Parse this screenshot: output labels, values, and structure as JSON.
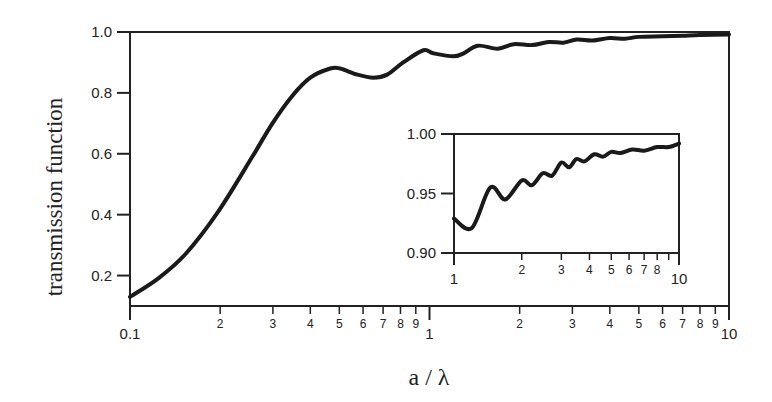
{
  "chart_data": [
    {
      "type": "line",
      "title": "",
      "xlabel": "a / λ",
      "ylabel": "transmission function",
      "xscale": "log",
      "xlim": [
        0.1,
        10
      ],
      "ylim": [
        0.1,
        1.0
      ],
      "grid": false,
      "legend": null,
      "x_major_ticks": [
        0.1,
        1,
        10
      ],
      "x_major_labels": [
        "0.1",
        "1",
        "10"
      ],
      "x_minor_labels": [
        "2",
        "3",
        "4",
        "5",
        "6",
        "7",
        "8",
        "9"
      ],
      "y_ticks": [
        0.2,
        0.4,
        0.6,
        0.8,
        1.0
      ],
      "y_tick_labels": [
        "0.2",
        "0.4",
        "0.6",
        "0.8",
        "1.0"
      ],
      "series": [
        {
          "name": "transmission function",
          "x": [
            0.1,
            0.124,
            0.153,
            0.197,
            0.256,
            0.299,
            0.348,
            0.4,
            0.466,
            0.503,
            0.574,
            0.649,
            0.722,
            0.817,
            0.954,
            1.03,
            1.2,
            1.3,
            1.45,
            1.69,
            1.91,
            2.2,
            2.5,
            2.8,
            3.1,
            3.5,
            4.0,
            4.5,
            5.0,
            6.0,
            7.0,
            8.0,
            10.0
          ],
          "y": [
            0.13,
            0.19,
            0.27,
            0.41,
            0.59,
            0.7,
            0.79,
            0.85,
            0.88,
            0.88,
            0.86,
            0.85,
            0.86,
            0.9,
            0.94,
            0.93,
            0.92,
            0.93,
            0.955,
            0.945,
            0.96,
            0.957,
            0.967,
            0.965,
            0.975,
            0.972,
            0.98,
            0.978,
            0.984,
            0.986,
            0.988,
            0.99,
            0.992
          ]
        }
      ]
    },
    {
      "type": "line",
      "title": "inset",
      "xlabel": "",
      "ylabel": "",
      "xscale": "log",
      "xlim": [
        1,
        10
      ],
      "ylim": [
        0.9,
        1.0
      ],
      "grid": false,
      "legend": null,
      "x_major_ticks": [
        1,
        10
      ],
      "x_major_labels": [
        "1",
        "10"
      ],
      "x_minor_labels": [
        "2",
        "3",
        "4",
        "5",
        "6",
        "7",
        "8",
        ""
      ],
      "y_ticks": [
        0.9,
        0.95,
        1.0
      ],
      "y_tick_labels": [
        "0.90",
        "0.95",
        "1.00"
      ],
      "series": [
        {
          "name": "transmission function (zoom)",
          "x": [
            1.0,
            1.2,
            1.45,
            1.69,
            2.0,
            2.22,
            2.48,
            2.73,
            3.0,
            3.25,
            3.5,
            3.8,
            4.2,
            4.6,
            5.0,
            5.5,
            6.2,
            7.0,
            8.0,
            9.0,
            10.0
          ],
          "y": [
            0.929,
            0.921,
            0.955,
            0.945,
            0.961,
            0.957,
            0.967,
            0.965,
            0.976,
            0.972,
            0.979,
            0.977,
            0.983,
            0.981,
            0.985,
            0.984,
            0.987,
            0.986,
            0.989,
            0.989,
            0.992
          ]
        }
      ]
    }
  ]
}
